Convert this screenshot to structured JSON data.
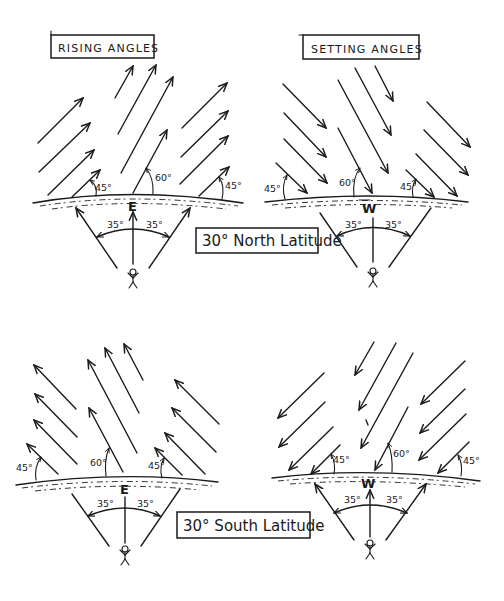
{
  "diagram": {
    "panels": [
      {
        "id": "north-rising",
        "title": "RISING ANGLES",
        "direction_label": "E",
        "angles": {
          "left": "45°",
          "center": "60°",
          "right": "45°"
        },
        "fan_angles": {
          "left": "35°",
          "right": "35°"
        }
      },
      {
        "id": "north-setting",
        "title": "SETTING ANGLES",
        "direction_label": "W",
        "angles": {
          "left": "45°",
          "center": "60°",
          "right": "45°"
        },
        "fan_angles": {
          "left": "35°",
          "right": "35°"
        }
      },
      {
        "id": "south-rising",
        "direction_label": "E",
        "angles": {
          "left": "45°",
          "center": "60°",
          "right": "45°"
        },
        "fan_angles": {
          "left": "35°",
          "right": "35°"
        }
      },
      {
        "id": "south-setting",
        "direction_label": "W",
        "angles": {
          "left": "45°",
          "center": "60°",
          "right": "45°"
        },
        "fan_angles": {
          "left": "35°",
          "right": "35°"
        }
      }
    ],
    "latitude_labels": {
      "north": "30° North Latitude",
      "south": "30° South Latitude"
    }
  }
}
